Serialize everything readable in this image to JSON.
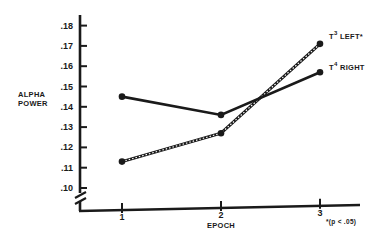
{
  "chart_data": {
    "type": "line",
    "title": "",
    "xlabel": "EPOCH",
    "ylabel": "ALPHA POWER",
    "x": [
      1,
      2,
      3
    ],
    "x_tick_labels": [
      "1",
      "2",
      "3"
    ],
    "y_tick_labels": [
      ".18",
      ".17",
      ".16",
      ".15",
      ".14",
      ".13",
      ".12",
      ".11",
      ".10"
    ],
    "y_ticks": [
      0.18,
      0.17,
      0.16,
      0.15,
      0.14,
      0.13,
      0.12,
      0.11,
      0.1
    ],
    "ylim": [
      0.1,
      0.18
    ],
    "axis_break": true,
    "grid": false,
    "legend_position": "inline-right",
    "series": [
      {
        "name": "T3 LEFT*",
        "label_main": "T",
        "label_sup": "3",
        "label_rest": " LEFT*",
        "style": "dashed-hatched",
        "values": [
          0.113,
          0.127,
          0.171
        ]
      },
      {
        "name": "T4 RIGHT",
        "label_main": "T",
        "label_sup": "4",
        "label_rest": " RIGHT",
        "style": "solid",
        "values": [
          0.145,
          0.136,
          0.157
        ]
      }
    ],
    "annotation": "*(p < .05)"
  },
  "colors": {
    "ink": "#1a1a1a",
    "background": "#ffffff"
  }
}
